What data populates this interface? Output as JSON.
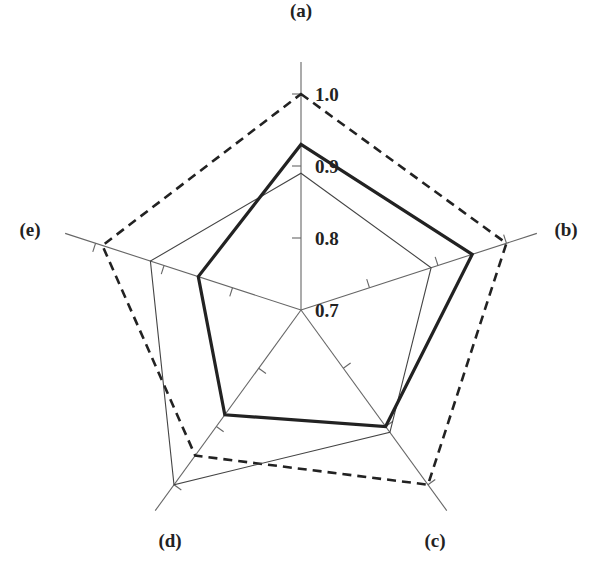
{
  "chart_data": {
    "type": "radar",
    "title": "",
    "axes": [
      "(a)",
      "(b)",
      "(c)",
      "(d)",
      "(e)"
    ],
    "radial_range": [
      0.7,
      1.0
    ],
    "radial_ticks": [
      0.7,
      0.8,
      0.9,
      1.0
    ],
    "radial_tick_labels": [
      "0.7",
      "0.8",
      "0.9",
      "1.0"
    ],
    "grid": false,
    "legend": null,
    "series": [
      {
        "name": "series-dashed",
        "style": "dashed",
        "color": "#222222",
        "width": 2.6,
        "values": [
          1.0,
          1.0,
          1.0,
          0.95,
          0.99
        ]
      },
      {
        "name": "series-thin",
        "style": "solid",
        "color": "#444444",
        "width": 1.1,
        "values": [
          0.89,
          0.89,
          0.91,
          1.0,
          0.92
        ]
      },
      {
        "name": "series-bold",
        "style": "solid",
        "color": "#222222",
        "width": 3.2,
        "values": [
          0.93,
          0.95,
          0.9,
          0.88,
          0.85
        ]
      }
    ]
  },
  "layout": {
    "center": [
      301,
      310
    ],
    "radius_at_max": 216,
    "axis_length": 248,
    "label_radius": 272,
    "axis_color": "#666666"
  }
}
